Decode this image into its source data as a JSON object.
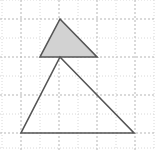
{
  "canvas": {
    "width": 155,
    "height": 150,
    "background": "#ffffff",
    "description": "Geometry diagram: a small shaded triangle resting on top of a larger unshaded triangle, drawn on a dotted grid"
  },
  "grid": {
    "label": "dotted-graph-grid",
    "major_color": "#b5b5b5",
    "minor_color": "#d8d8d8",
    "major_spacing": 38,
    "minor_spacing": 19,
    "major_x": [
      21,
      59,
      97,
      135
    ],
    "major_y": [
      19,
      57,
      95,
      133
    ],
    "minor_x": [
      2,
      40,
      78,
      116,
      154
    ],
    "minor_y": [
      0,
      38,
      76,
      114,
      148
    ],
    "style": "dotted",
    "visible": true
  },
  "chart_data": {
    "type": "diagram",
    "title": "",
    "xlabel": "",
    "ylabel": "",
    "xlim": [
      0,
      155
    ],
    "ylim": [
      0,
      150
    ],
    "grid": true,
    "shapes": [
      {
        "name": "shaded-triangle",
        "kind": "triangle",
        "fill": "#d2d2d2",
        "stroke": "#555555",
        "stroke_width": 1.6,
        "points": [
          [
            60,
            19
          ],
          [
            40,
            57
          ],
          [
            97,
            57
          ]
        ],
        "points_str": "60,19 40,57 97,57",
        "vertices": [
          {
            "label": "apex",
            "x": 60,
            "y": 19
          },
          {
            "label": "bottom-left",
            "x": 40,
            "y": 57
          },
          {
            "label": "bottom-right",
            "x": 97,
            "y": 57
          }
        ]
      },
      {
        "name": "large-triangle",
        "kind": "triangle",
        "fill": "none",
        "stroke": "#555555",
        "stroke_width": 1.6,
        "points": [
          [
            60,
            57
          ],
          [
            21,
            133
          ],
          [
            134,
            133
          ]
        ],
        "points_str": "60,57 21,133 134,133",
        "vertices": [
          {
            "label": "apex",
            "x": 60,
            "y": 57
          },
          {
            "label": "bottom-left",
            "x": 21,
            "y": 133
          },
          {
            "label": "bottom-right",
            "x": 134,
            "y": 133
          }
        ]
      }
    ],
    "annotations": []
  }
}
